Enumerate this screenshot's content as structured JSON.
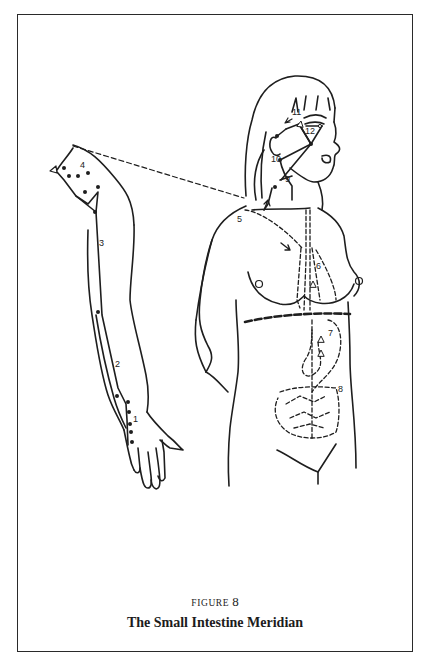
{
  "figure": {
    "label_prefix": "FIGURE",
    "number": "8",
    "title": "The Small Intestine Meridian"
  },
  "diagram": {
    "views": [
      "right arm (lateral)",
      "female torso and head (front, three-quarter)"
    ],
    "point_labels": [
      "1",
      "2",
      "3",
      "4",
      "5",
      "6",
      "7",
      "8",
      "9",
      "10",
      "11",
      "12"
    ],
    "line_styles": {
      "external_path": "solid line with dots",
      "internal_path": "dashed line",
      "connection_arm_to_shoulder": "dashed line",
      "diaphragm": "heavy dashed line"
    },
    "colors": {
      "ink": "#1e1e1e",
      "background": "#ffffff"
    }
  }
}
